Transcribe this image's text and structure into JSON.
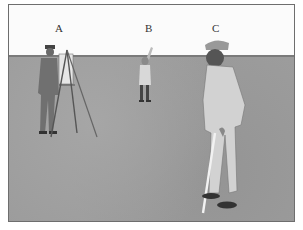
{
  "figure": {
    "labels": [
      {
        "id": "A",
        "text": "A"
      },
      {
        "id": "B",
        "text": "B"
      },
      {
        "id": "C",
        "text": "C"
      }
    ],
    "colors": {
      "sky": "#fbfbfb",
      "ground": "#9c9c9c",
      "border": "#6e6e6e"
    }
  }
}
